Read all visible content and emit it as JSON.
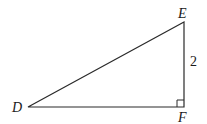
{
  "diagram": {
    "type": "right-triangle",
    "vertices": {
      "D": {
        "label": "D",
        "x": 28,
        "y": 107
      },
      "E": {
        "label": "E",
        "x": 184,
        "y": 22
      },
      "F": {
        "label": "F",
        "x": 184,
        "y": 107
      }
    },
    "right_angle_at": "F",
    "side_labels": {
      "EF": "2"
    },
    "colors": {
      "stroke": "#2a2a2a",
      "text": "#1a1a1a",
      "background": "#ffffff"
    }
  }
}
